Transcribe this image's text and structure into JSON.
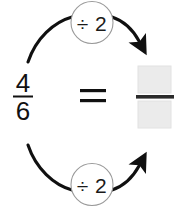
{
  "diagram": {
    "type": "fraction-equivalence",
    "background_color": "#ffffff",
    "ink_color": "#1a1a1a",
    "left_fraction": {
      "numerator": "4",
      "denominator": "6",
      "bar_color": "#111111"
    },
    "equals_sign": "=",
    "operations": [
      {
        "position": "top",
        "label": "÷ 2",
        "circle_stroke": "#9a9a9a",
        "circle_fill": "#ffffff"
      },
      {
        "position": "bottom",
        "label": "÷ 2",
        "circle_stroke": "#9a9a9a",
        "circle_fill": "#ffffff"
      }
    ],
    "right_fraction": {
      "numerator": "",
      "denominator": "",
      "numerator_placeholder": "",
      "denominator_placeholder": "",
      "box_fill": "#ebebeb",
      "box_stroke": "#e0e0e0",
      "bar_color": "#2b2b2b"
    },
    "arrows": [
      {
        "name": "top-arrow",
        "from": "numerator-4",
        "to": "numerator-box",
        "direction": "down-right",
        "color": "#101010"
      },
      {
        "name": "bottom-arrow",
        "from": "denominator-6",
        "to": "denominator-box",
        "direction": "up-right",
        "color": "#101010"
      }
    ]
  }
}
